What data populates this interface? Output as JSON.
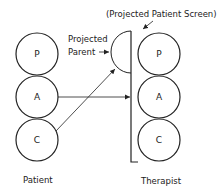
{
  "title": "(Projected Patient Screen)",
  "projected_parent_label_line1": "Projected",
  "projected_parent_label_line2": "Parent",
  "patient": {
    "label": "Patient",
    "states": [
      "P",
      "A",
      "C"
    ]
  },
  "therapist": {
    "label": "Therapist",
    "states": [
      "P",
      "A",
      "C"
    ]
  },
  "colors": {
    "line": "#222222",
    "background": "#ffffff"
  }
}
